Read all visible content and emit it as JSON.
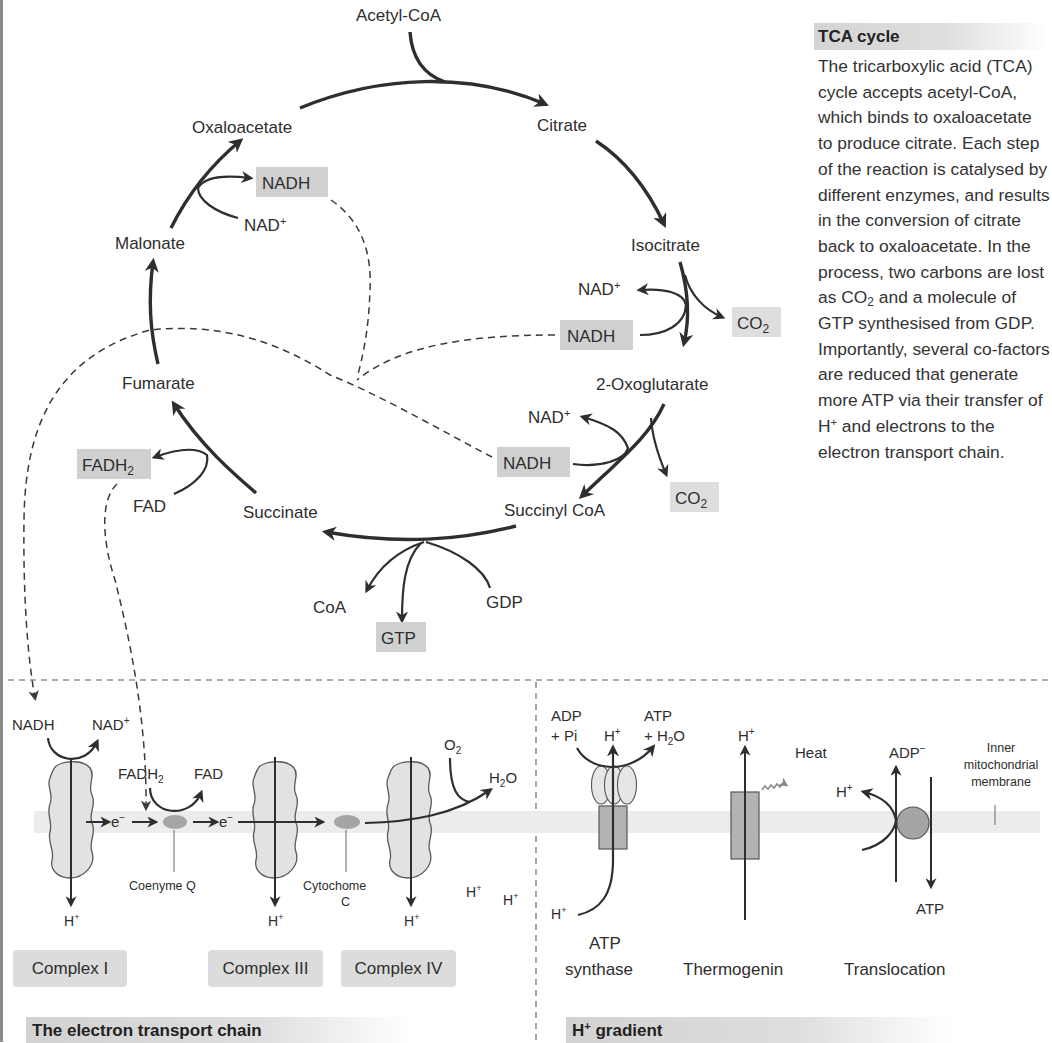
{
  "tca_cycle": {
    "metabolites": {
      "acetyl_coa": "Acetyl-CoA",
      "citrate": "Citrate",
      "isocitrate": "Isocitrate",
      "oxoglutarate": "2-Oxoglutarate",
      "succinyl_coa": "Succinyl CoA",
      "succinate": "Succinate",
      "fumarate": "Fumarate",
      "malonate": "Malonate",
      "oxaloacetate": "Oxaloacetate"
    },
    "cofactors": {
      "nadh_1": "NADH",
      "nad_1": "NAD",
      "nadh_2": "NADH",
      "nad_2": "NAD",
      "nadh_3": "NADH",
      "nad_3": "NAD",
      "co2": "CO",
      "co2_sub": "2",
      "fadh": "FADH",
      "fadh_sub": "2",
      "fad": "FAD",
      "coa": "CoA",
      "gtp": "GTP",
      "gdp": "GDP",
      "plus": "+"
    }
  },
  "side_panel": {
    "title": "TCA cycle",
    "body_part1": "The tricarboxylic acid (TCA) cycle accepts acetyl-CoA, which binds to oxaloacetate to produce citrate. Each step of the reaction is catalysed by different enzymes, and results in the conversion of citrate back to oxaloacetate. In the process, two carbons are lost as CO",
    "body_sub": "2",
    "body_part2": " and a molecule of GTP synthesised from GDP. Importantly, several co-factors are reduced that generate more ATP via their transfer of H",
    "body_sup": "+",
    "body_part3": " and electrons to the electron transport chain."
  },
  "electron_transport_chain": {
    "title": "The electron transport chain",
    "nadh": "NADH",
    "nad": "NAD",
    "fadh": "FADH",
    "fadh_sub": "2",
    "fad": "FAD",
    "electron": "e",
    "electron_sup": "−",
    "coenzyme_q": "Coenyme Q",
    "cytochrome_line1": "Cytochome",
    "cytochrome_line2": "C",
    "o2": "O",
    "o2_sub": "2",
    "h2o_h": "H",
    "h2o_sub": "2",
    "h2o_o": "O",
    "proton": "H",
    "plus": "+",
    "complexes": [
      "Complex I",
      "Complex III",
      "Complex IV"
    ]
  },
  "h_gradient": {
    "title_main": "H",
    "title_sup": "+",
    "title_rest": " gradient",
    "atp_synthase": {
      "adp": "ADP",
      "pi": "+ Pi",
      "atp": "ATP",
      "h2o_prefix": "+ H",
      "h2o_sub": "2",
      "h2o_suffix": "O",
      "label_line1": "ATP",
      "label_line2": "synthase"
    },
    "thermogenin": {
      "heat": "Heat",
      "label": "Thermogenin"
    },
    "translocation": {
      "adp": "ADP",
      "adp_sup": "−",
      "atp": "ATP",
      "label": "Translocation"
    },
    "membrane_label": [
      "Inner",
      "mitochondrial",
      "membrane"
    ],
    "proton": "H",
    "plus": "+"
  },
  "colors": {
    "highlight_box": "#d0d0d0",
    "membrane": "#ececec",
    "protein": "#e2e2e2",
    "carrier": "#a5a5a5",
    "ink": "#2e2e2e"
  }
}
